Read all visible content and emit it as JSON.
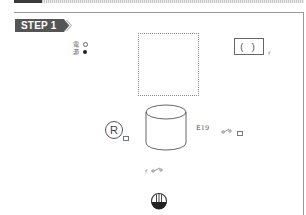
{
  "header": {
    "step_label": "STEP 1"
  },
  "legend": {
    "items": [
      {
        "label": "電",
        "marker": "open-circle"
      },
      {
        "label": "源",
        "marker": "filled-circle"
      }
    ]
  },
  "diagram": {
    "paren_box_text": "( )",
    "cylinder_label": "E19",
    "r_symbol_text": "R",
    "tick_mark": "ｨ",
    "colors": {
      "badge_bg": "#555555",
      "line": "#666666",
      "frame": "#9a9a9a"
    }
  }
}
